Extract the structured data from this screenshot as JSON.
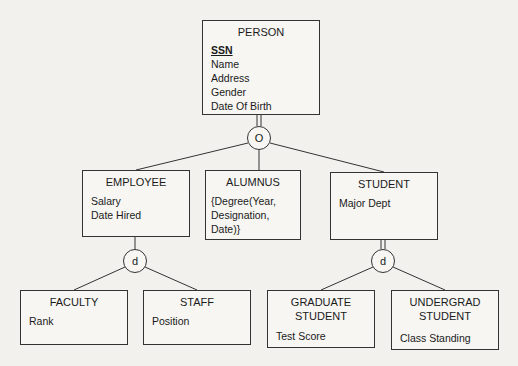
{
  "diagram": {
    "type": "EER specialization hierarchy",
    "entities": {
      "person": {
        "name": "PERSON",
        "key_attribute": "SSN",
        "attributes": [
          "Name",
          "Address",
          "Gender",
          "Date Of Birth"
        ]
      },
      "employee": {
        "name": "EMPLOYEE",
        "attributes": [
          "Salary",
          "Date Hired"
        ]
      },
      "alumnus": {
        "name": "ALUMNUS",
        "attributes": [
          "{Degree(Year,",
          "Designation,",
          "Date)}"
        ]
      },
      "student": {
        "name": "STUDENT",
        "attributes": [
          "Major Dept"
        ]
      },
      "faculty": {
        "name": "FACULTY",
        "attributes": [
          "Rank"
        ]
      },
      "staff": {
        "name": "STAFF",
        "attributes": [
          "Position"
        ]
      },
      "graduate_student": {
        "name_line1": "GRADUATE",
        "name_line2": "STUDENT",
        "attributes": [
          "Test Score"
        ]
      },
      "undergrad_student": {
        "name_line1": "UNDERGRAD",
        "name_line2": "STUDENT",
        "attributes": [
          "Class Standing"
        ]
      }
    },
    "specializations": {
      "person": {
        "symbol": "O",
        "meaning": "overlapping",
        "participation": "total"
      },
      "employee": {
        "symbol": "d",
        "meaning": "disjoint",
        "participation": "partial"
      },
      "student": {
        "symbol": "d",
        "meaning": "disjoint",
        "participation": "total"
      }
    }
  }
}
